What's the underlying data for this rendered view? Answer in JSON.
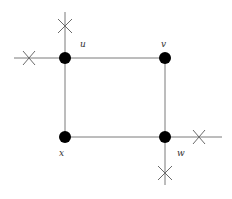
{
  "diagram": {
    "type": "graph",
    "nodes": [
      {
        "id": "u",
        "label": "u",
        "x": 65,
        "y": 58
      },
      {
        "id": "v",
        "label": "v",
        "x": 165,
        "y": 58
      },
      {
        "id": "x",
        "label": "x",
        "x": 65,
        "y": 137
      },
      {
        "id": "w",
        "label": "w",
        "x": 165,
        "y": 137
      }
    ],
    "edges": [
      {
        "from": "u",
        "to": "v"
      },
      {
        "from": "v",
        "to": "w"
      },
      {
        "from": "w",
        "to": "x"
      },
      {
        "from": "x",
        "to": "u"
      }
    ],
    "crossed_half_edges": [
      {
        "at": "u",
        "direction": "left"
      },
      {
        "at": "u",
        "direction": "up"
      },
      {
        "at": "w",
        "direction": "right"
      },
      {
        "at": "w",
        "direction": "down"
      }
    ],
    "colors": {
      "node": "#000000",
      "edge": "#7a7a7a",
      "background": "#ffffff"
    }
  }
}
